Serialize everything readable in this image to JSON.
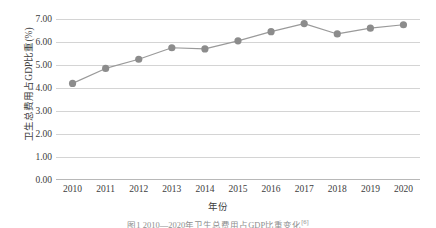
{
  "chart_data": {
    "type": "line",
    "title": "",
    "xlabel": "年份",
    "ylabel": "卫生总费用占GDP比重(%)",
    "categories": [
      "2010",
      "2011",
      "2012",
      "2013",
      "2014",
      "2015",
      "2016",
      "2017",
      "2018",
      "2019",
      "2020"
    ],
    "values": [
      4.2,
      4.85,
      5.25,
      5.75,
      5.7,
      6.05,
      6.45,
      6.8,
      6.35,
      6.6,
      6.75
    ],
    "series": [
      {
        "name": "卫生总费用占GDP比重(%)",
        "values": [
          4.2,
          4.85,
          5.25,
          5.75,
          5.7,
          6.05,
          6.45,
          6.8,
          6.35,
          6.6,
          6.75
        ]
      }
    ],
    "ylim": [
      0.0,
      7.0
    ],
    "yticks": [
      "0.00",
      "1.00",
      "2.00",
      "3.00",
      "4.00",
      "5.00",
      "6.00",
      "7.00"
    ],
    "ytick_values": [
      0.0,
      1.0,
      2.0,
      3.0,
      4.0,
      5.0,
      6.0,
      7.0
    ],
    "grid": true,
    "legend": false,
    "legend_position": "none",
    "marker": "circle",
    "line_color": "#9a9a9a",
    "marker_color": "#8c8c8c",
    "grid_color": "#d4d4d4"
  },
  "caption": {
    "text": "图1   2010—2020年卫生总费用占GDP比重变化",
    "ref": "[6]"
  }
}
